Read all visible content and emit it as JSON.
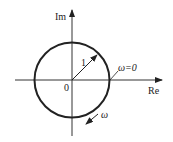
{
  "diagram": {
    "type": "complex-plane-unit-circle",
    "axes": {
      "imaginary_label": "Im",
      "real_label": "Re",
      "origin_label": "0"
    },
    "circle": {
      "radius_label": "1"
    },
    "annotations": {
      "start_point_label": "ω=0",
      "direction_label": "ω"
    },
    "colors": {
      "stroke": "#222222",
      "background": "#ffffff"
    }
  }
}
